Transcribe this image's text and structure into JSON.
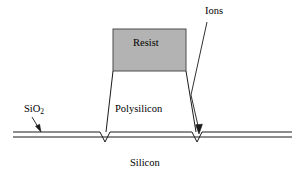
{
  "figure": {
    "background_color": "#ffffff",
    "line_color": "#1a1a1a",
    "resist_fill_color": "#b3b3b3",
    "resist_stroke_color": "#4d4d4d",
    "width": 308,
    "height": 185
  },
  "labels": {
    "ions": "Ions",
    "resist": "Resist",
    "polysilicon": "Polysilicon",
    "sio2_base": "SiO",
    "sio2_subscript": "2",
    "silicon": "Silicon"
  },
  "geometry": {
    "oxide_line_top_y": 132,
    "oxide_line_bottom_y": 137,
    "oxide_line_left_x": 13,
    "oxide_line_right_x": 292,
    "resist_box": {
      "x": 113,
      "y": 29,
      "width": 73,
      "height": 42
    },
    "poly_left_wall_top_x": 113,
    "poly_left_wall_bottom_x": 106,
    "poly_right_wall_top_x": 186,
    "poly_right_wall_bottom_x": 196,
    "left_notch_center_x": 105,
    "right_notch_center_x": 197,
    "notch_depth": 10,
    "ion_arrow_start": [
      207,
      22
    ],
    "ion_arrow_end": [
      199,
      133
    ],
    "sio2_arrow_start": [
      32,
      117
    ],
    "sio2_arrow_end": [
      40,
      131
    ]
  }
}
